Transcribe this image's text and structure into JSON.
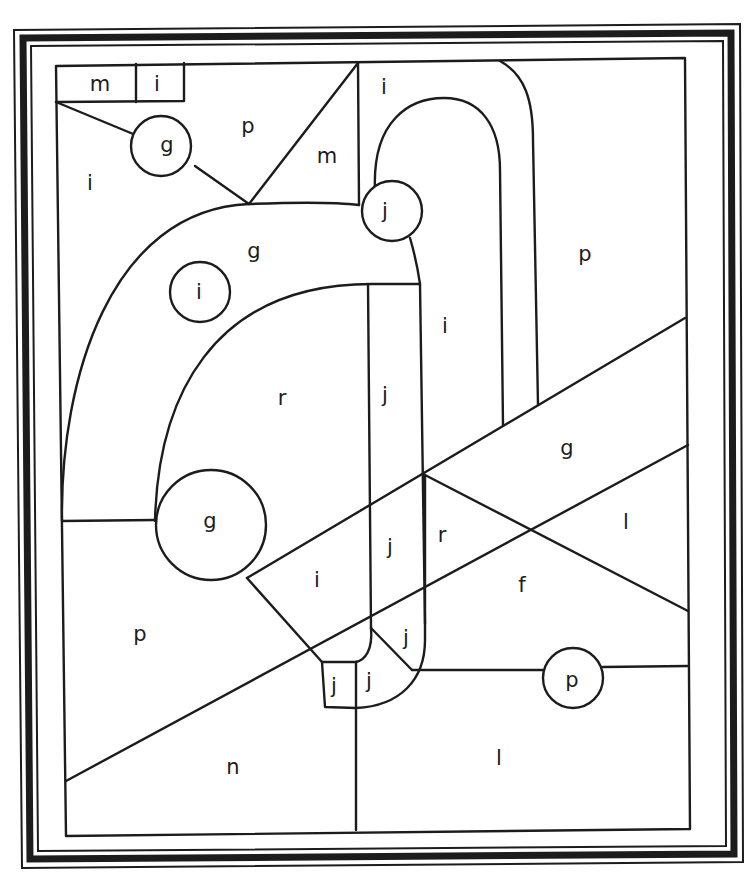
{
  "palette": {
    "ink": "#1c1c1c",
    "paper": "#ffffff"
  },
  "frame": {
    "style": "triple-line border with thick black band",
    "outer_corners": [
      [
        14,
        30
      ],
      [
        740,
        24
      ],
      [
        743,
        862
      ],
      [
        22,
        868
      ]
    ]
  },
  "regions": [
    {
      "id": "r1",
      "letter": "m",
      "x": 100,
      "y": 84
    },
    {
      "id": "r2",
      "letter": "i",
      "x": 157,
      "y": 84
    },
    {
      "id": "r3",
      "letter": "p",
      "x": 248,
      "y": 126
    },
    {
      "id": "r4",
      "letter": "g",
      "x": 167,
      "y": 145,
      "circle": true
    },
    {
      "id": "r5",
      "letter": "i",
      "x": 90,
      "y": 183
    },
    {
      "id": "r6",
      "letter": "m",
      "x": 327,
      "y": 156
    },
    {
      "id": "r7",
      "letter": "i",
      "x": 384,
      "y": 87
    },
    {
      "id": "r8",
      "letter": "j",
      "x": 385,
      "y": 211,
      "circle": true
    },
    {
      "id": "r9",
      "letter": "p",
      "x": 585,
      "y": 254
    },
    {
      "id": "r10",
      "letter": "g",
      "x": 254,
      "y": 251
    },
    {
      "id": "r11",
      "letter": "i",
      "x": 199,
      "y": 292,
      "circle": true
    },
    {
      "id": "r12",
      "letter": "i",
      "x": 445,
      "y": 326
    },
    {
      "id": "r13",
      "letter": "r",
      "x": 282,
      "y": 398
    },
    {
      "id": "r14",
      "letter": "j",
      "x": 385,
      "y": 395
    },
    {
      "id": "r15",
      "letter": "g",
      "x": 567,
      "y": 448
    },
    {
      "id": "r16",
      "letter": "g",
      "x": 210,
      "y": 521,
      "circle": true
    },
    {
      "id": "r17",
      "letter": "j",
      "x": 390,
      "y": 547
    },
    {
      "id": "r18",
      "letter": "r",
      "x": 442,
      "y": 535
    },
    {
      "id": "r19",
      "letter": "l",
      "x": 626,
      "y": 522
    },
    {
      "id": "r20",
      "letter": "i",
      "x": 317,
      "y": 580
    },
    {
      "id": "r21",
      "letter": "f",
      "x": 522,
      "y": 585
    },
    {
      "id": "r22",
      "letter": "p",
      "x": 140,
      "y": 634
    },
    {
      "id": "r23",
      "letter": "j",
      "x": 406,
      "y": 638
    },
    {
      "id": "r24",
      "letter": "p",
      "x": 572,
      "y": 680,
      "circle": true
    },
    {
      "id": "r25",
      "letter": "j",
      "x": 334,
      "y": 686
    },
    {
      "id": "r26",
      "letter": "j",
      "x": 369,
      "y": 681
    },
    {
      "id": "r27",
      "letter": "n",
      "x": 233,
      "y": 767
    },
    {
      "id": "r28",
      "letter": "l",
      "x": 499,
      "y": 758
    }
  ]
}
